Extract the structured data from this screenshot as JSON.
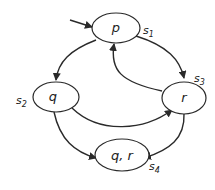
{
  "diagram": {
    "type": "kripke-structure",
    "initial_state": "s1",
    "states": [
      {
        "id": "s1",
        "name": "s",
        "sub": "1",
        "label": "p"
      },
      {
        "id": "s2",
        "name": "s",
        "sub": "2",
        "label": "q"
      },
      {
        "id": "s3",
        "name": "s",
        "sub": "3",
        "label": "r"
      },
      {
        "id": "s4",
        "name": "s",
        "sub": "4",
        "label": "q, r"
      }
    ],
    "transitions": [
      {
        "from": "s1",
        "to": "s2"
      },
      {
        "from": "s1",
        "to": "s3"
      },
      {
        "from": "s3",
        "to": "s1"
      },
      {
        "from": "s2",
        "to": "s3"
      },
      {
        "from": "s2",
        "to": "s4"
      },
      {
        "from": "s3",
        "to": "s4"
      }
    ]
  }
}
